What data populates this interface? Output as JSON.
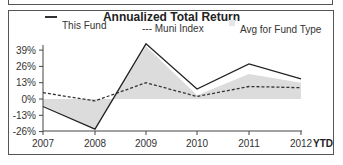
{
  "chart_data": {
    "type": "line",
    "title": "Annualized Total Return",
    "xlabel": "",
    "ylabel": "",
    "categories": [
      "2007",
      "2008",
      "2009",
      "2010",
      "2011",
      "2012"
    ],
    "x_suffix_label": "YTD",
    "yticks": [
      "39%",
      "26%",
      "13%",
      "0%",
      "-13%",
      "-26%"
    ],
    "ylim": [
      -26,
      45
    ],
    "grid": false,
    "legend_position": "top",
    "series": [
      {
        "name": "This Fund",
        "style": "solid",
        "values": [
          -6,
          -24,
          44,
          8,
          28,
          16
        ]
      },
      {
        "name": "Muni Index",
        "style": "dashed",
        "values": [
          5,
          -1.5,
          13,
          2,
          10,
          9
        ]
      },
      {
        "name": "Avg for Fund Type",
        "style": "area",
        "values": [
          -5,
          -24,
          42,
          3,
          20,
          13
        ]
      }
    ]
  },
  "legend": {
    "fund": "This Fund",
    "index": "--- Muni Index",
    "avg": "Avg for Fund Type"
  },
  "colors": {
    "fund_line": "#222222",
    "index_line": "#333333",
    "avg_area": "#dcdcdc",
    "border": "#555555"
  }
}
